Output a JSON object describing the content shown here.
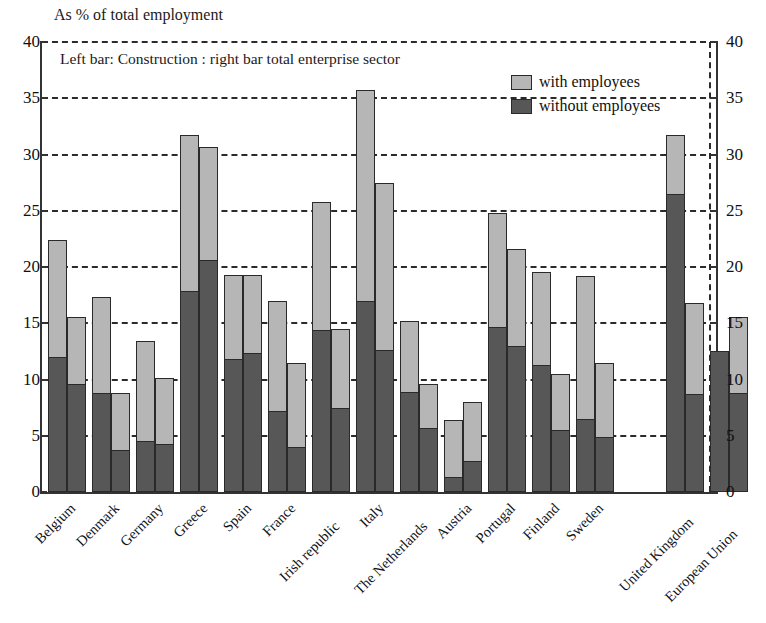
{
  "chart_data": {
    "type": "bar",
    "title": "As % of total employment",
    "annotation": "Left bar: Construction  : right bar total enterprise sector",
    "xlabel": "",
    "ylabel": "",
    "ylim": [
      0,
      40
    ],
    "ytick_step": 5,
    "yticks": [
      "0",
      "5",
      "10",
      "15",
      "20",
      "25",
      "30",
      "35",
      "40"
    ],
    "grid": true,
    "grid_style": "dashed-horizontal",
    "dual_axis": true,
    "legend_position": "top-right",
    "legend": [
      "with employees",
      "without employees"
    ],
    "separator_after": "United Kingdom",
    "colors": {
      "with_employees": "#b6b6b6",
      "without_employees": "#575757",
      "axis": "#333333",
      "grid": "#2b2b2b",
      "background": "#ffffff"
    },
    "categories": [
      "Belgium",
      "Denmark",
      "Germany",
      "Greece",
      "Spain",
      "France",
      "Irish republic",
      "Italy",
      "The Netherlands",
      "Austria",
      "Portugal",
      "Finland",
      "Sweden",
      "United Kingdom",
      "European Union"
    ],
    "series": [
      {
        "name": "Construction (left bar) — total",
        "bar": "left",
        "segment": "total",
        "values": [
          22.4,
          17.3,
          13.4,
          31.7,
          19.3,
          17.0,
          25.8,
          35.7,
          15.2,
          6.4,
          24.8,
          19.6,
          19.2,
          31.7,
          12.5
        ]
      },
      {
        "name": "Construction (left bar) — without employees",
        "bar": "left",
        "segment": "without employees",
        "values": [
          12.0,
          8.8,
          4.5,
          17.9,
          11.8,
          7.2,
          14.4,
          17.0,
          8.9,
          1.3,
          14.7,
          11.3,
          6.5,
          26.5,
          12.5
        ]
      },
      {
        "name": "Total enterprise sector (right bar) — total",
        "bar": "right",
        "segment": "total",
        "values": [
          15.6,
          8.8,
          10.1,
          30.7,
          19.3,
          11.5,
          14.5,
          27.5,
          9.6,
          8.0,
          21.6,
          10.5,
          11.5,
          16.8,
          15.6
        ]
      },
      {
        "name": "Total enterprise sector (right bar) — without employees",
        "bar": "right",
        "segment": "without employees",
        "values": [
          9.6,
          3.7,
          4.3,
          20.6,
          12.4,
          4.0,
          7.5,
          12.6,
          5.7,
          2.8,
          13.0,
          5.5,
          4.9,
          8.7,
          8.8
        ]
      }
    ]
  }
}
